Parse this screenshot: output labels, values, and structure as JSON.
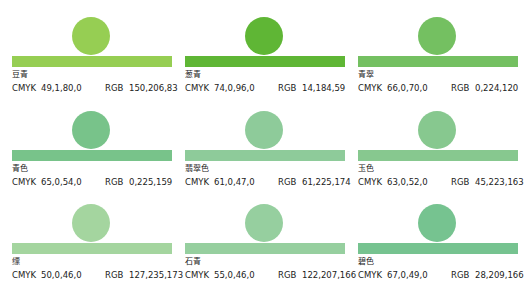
{
  "labels": {
    "cmyk": "CMYK",
    "rgb": "RGB"
  },
  "swatches": [
    {
      "name": "豆青",
      "cmyk": "49,1,80,0",
      "rgb": "150,206,83",
      "color": "#96ce53"
    },
    {
      "name": "葱青",
      "cmyk": "74,0,96,0",
      "rgb": "14,184,59",
      "color": "#5fb635"
    },
    {
      "name": "青翠",
      "cmyk": "66,0,70,0",
      "rgb": "0,224,120",
      "color": "#74c061"
    },
    {
      "name": "青色",
      "cmyk": "65,0,54,0",
      "rgb": "0,225,159",
      "color": "#78c38a"
    },
    {
      "name": "翡翠色",
      "cmyk": "61,0,47,0",
      "rgb": "61,225,174",
      "color": "#8ecb9a"
    },
    {
      "name": "玉色",
      "cmyk": "63,0,52,0",
      "rgb": "45,223,163",
      "color": "#87c88f"
    },
    {
      "name": "缥",
      "cmyk": "50,0,46,0",
      "rgb": "127,235,173",
      "color": "#a4d59f"
    },
    {
      "name": "石青",
      "cmyk": "55,0,46,0",
      "rgb": "122,207,166",
      "color": "#96cf9f"
    },
    {
      "name": "碧色",
      "cmyk": "67,0,49,0",
      "rgb": "28,209,166",
      "color": "#76c390"
    }
  ]
}
